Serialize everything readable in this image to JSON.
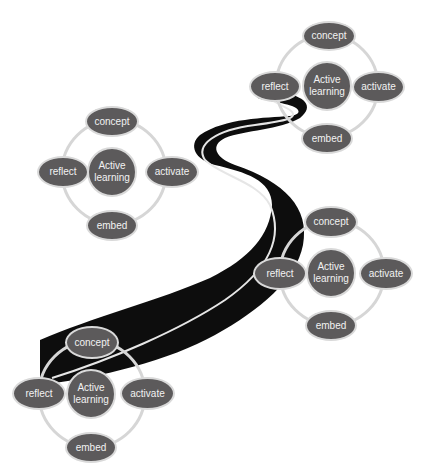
{
  "diagram": {
    "type": "road-with-learning-cycles",
    "colors": {
      "node_fill": "#5c5a5b",
      "node_border": "#d9d9d9",
      "ring": "#d6d6d6",
      "road": "#0d0d0d",
      "road_line": "#e6e6e6",
      "text": "#f2f2f2"
    },
    "clusters": [
      {
        "id": "cluster-top-right",
        "cx": 327,
        "cy": 86,
        "r": 51,
        "nodes": {
          "concept": "concept",
          "center": "Active learning",
          "reflect": "reflect",
          "activate": "activate",
          "embed": "embed"
        }
      },
      {
        "id": "cluster-left",
        "cx": 114,
        "cy": 172,
        "r": 52,
        "nodes": {
          "concept": "concept",
          "center": "Active learning",
          "reflect": "reflect",
          "activate": "activate",
          "embed": "embed"
        }
      },
      {
        "id": "cluster-right-middle",
        "cx": 332,
        "cy": 273,
        "r": 52,
        "nodes": {
          "concept": "concept",
          "center": "Active learning",
          "reflect": "reflect",
          "activate": "activate",
          "embed": "embed"
        }
      },
      {
        "id": "cluster-bottom-left",
        "cx": 92,
        "cy": 394,
        "r": 53,
        "nodes": {
          "concept": "concept",
          "center": "Active learning",
          "reflect": "reflect",
          "activate": "activate",
          "embed": "embed"
        }
      }
    ]
  }
}
